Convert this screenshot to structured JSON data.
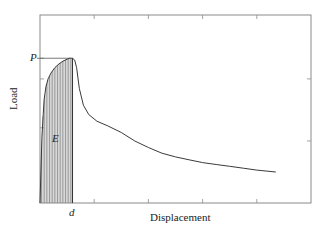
{
  "chart_data": {
    "type": "area",
    "title": "",
    "xlabel": "Displacement",
    "ylabel": "Load",
    "xlim": [
      0,
      10
    ],
    "ylim": [
      0,
      10
    ],
    "grid": false,
    "legend": null,
    "annotations": {
      "peak_load_label": "P",
      "peak_load_value": 7.7,
      "displacement_label": "d",
      "displacement_value": 1.2,
      "energy_label": "E",
      "energy_region": "shaded area under curve from x=0 to x=d (vertical hatching)"
    },
    "series": [
      {
        "name": "Load-displacement curve",
        "x": [
          0,
          0.07,
          0.15,
          0.22,
          0.3,
          0.4,
          0.55,
          0.7,
          0.85,
          1.0,
          1.1,
          1.2,
          1.28,
          1.35,
          1.45,
          1.6,
          1.8,
          2.1,
          2.5,
          3.0,
          3.5,
          4.0,
          4.5,
          5.0,
          5.5,
          6.0,
          6.5,
          7.0,
          7.5,
          8.0,
          8.7
        ],
        "y": [
          0,
          3.5,
          5.5,
          6.2,
          6.6,
          6.9,
          7.2,
          7.4,
          7.55,
          7.65,
          7.7,
          7.7,
          7.6,
          7.2,
          6.1,
          5.2,
          4.7,
          4.35,
          4.1,
          3.75,
          3.3,
          2.95,
          2.65,
          2.45,
          2.3,
          2.15,
          2.05,
          1.95,
          1.85,
          1.75,
          1.65
        ]
      }
    ],
    "ticks": {
      "x_bottom_positions": [
        2,
        4,
        6,
        8
      ],
      "x_top_positions": [
        2,
        4,
        6,
        8
      ],
      "y_left_positions": [
        4,
        6.6,
        7.7
      ],
      "y_right_positions": [
        3.3,
        6.6
      ],
      "labels_shown": false
    }
  },
  "labels": {
    "y_axis": "Load",
    "x_axis": "Displacement",
    "peak": "P",
    "disp": "d",
    "energy": "E"
  },
  "colors": {
    "axis": "#8a8a8a",
    "curve": "#3a3a3a",
    "hatch": "#555555",
    "text": "#222222"
  }
}
